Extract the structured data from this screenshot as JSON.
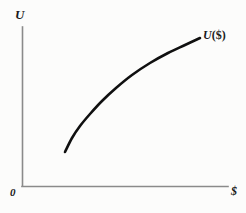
{
  "figure": {
    "background_color": "#fcfcfb",
    "axis_color": "#8a8a8a",
    "curve_color": "#101010"
  },
  "labels": {
    "y_axis": "U",
    "x_axis": "$",
    "origin": "0",
    "curve_name": "U",
    "curve_arg": "($)"
  },
  "chart_data": {
    "type": "line",
    "title": "",
    "xlabel": "$",
    "ylabel": "U",
    "grid": false,
    "legend": "none",
    "annotations": [
      {
        "text": "U ($)",
        "x": 200,
        "y": 38,
        "description": "curve end label for utility function of money"
      },
      {
        "text": "0",
        "x": 14,
        "y": 192,
        "description": "origin label"
      }
    ],
    "axis_origin_px": {
      "x": 22,
      "y": 186
    },
    "axis_extent_px": {
      "y_top": 27,
      "x_right": 228
    },
    "xlim": [
      0,
      1
    ],
    "ylim": [
      0,
      1
    ],
    "series": [
      {
        "name": "U ($)",
        "shape": "concave-increasing",
        "description": "Concave increasing utility curve showing diminishing marginal utility of money",
        "points_px": [
          {
            "x": 65,
            "y": 152
          },
          {
            "x": 72,
            "y": 138
          },
          {
            "x": 80,
            "y": 126
          },
          {
            "x": 90,
            "y": 114
          },
          {
            "x": 102,
            "y": 101
          },
          {
            "x": 116,
            "y": 88
          },
          {
            "x": 132,
            "y": 75
          },
          {
            "x": 150,
            "y": 63
          },
          {
            "x": 168,
            "y": 53
          },
          {
            "x": 185,
            "y": 45
          },
          {
            "x": 200,
            "y": 38
          }
        ],
        "x": [
          0.21,
          0.24,
          0.28,
          0.33,
          0.39,
          0.46,
          0.53,
          0.62,
          0.71,
          0.79,
          0.86
        ],
        "y": [
          0.21,
          0.3,
          0.38,
          0.45,
          0.54,
          0.62,
          0.7,
          0.77,
          0.84,
          0.89,
          0.93
        ]
      }
    ]
  }
}
